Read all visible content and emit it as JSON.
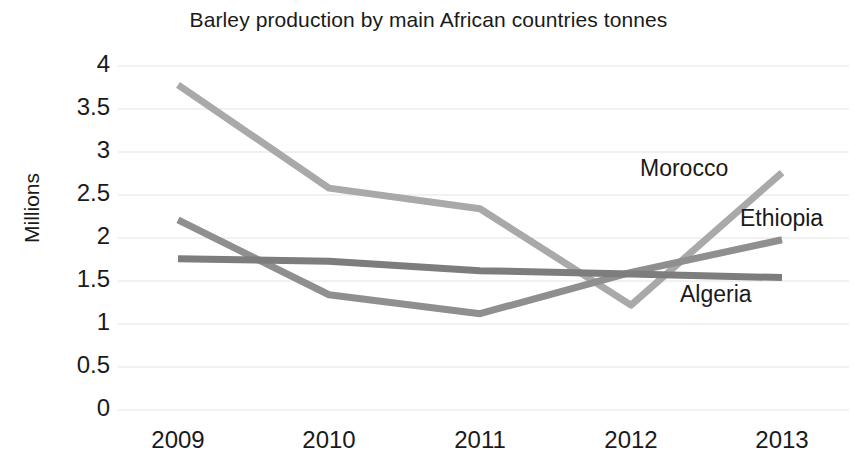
{
  "chart_data": {
    "type": "line",
    "title": "Barley production by main African countries tonnes",
    "xlabel": "",
    "ylabel": "Millions",
    "categories": [
      "2009",
      "2010",
      "2011",
      "2012",
      "2013"
    ],
    "x": [
      2009,
      2010,
      2011,
      2012,
      2013
    ],
    "ylim": [
      0,
      4
    ],
    "y_ticks": [
      "0",
      "0.5",
      "1",
      "1.5",
      "2",
      "2.5",
      "3",
      "3.5",
      "4"
    ],
    "y_tick_values": [
      0,
      0.5,
      1,
      1.5,
      2,
      2.5,
      3,
      3.5,
      4
    ],
    "grid": true,
    "legend_position": "inline-right-annotations",
    "series": [
      {
        "name": "Morocco",
        "color": "#a9a9a9",
        "values": [
          3.78,
          2.58,
          2.34,
          1.22,
          2.76
        ]
      },
      {
        "name": "Ethiopia",
        "color": "#8f8f8f",
        "values": [
          2.21,
          1.34,
          1.12,
          1.6,
          1.98
        ]
      },
      {
        "name": "Algeria",
        "color": "#7d7d7d",
        "values": [
          1.76,
          1.73,
          1.62,
          1.58,
          1.54
        ]
      }
    ],
    "annotations": [
      {
        "text": "Morocco",
        "x_px": 640,
        "y_px": 157
      },
      {
        "text": "Ethiopia",
        "x_px": 740,
        "y_px": 207
      },
      {
        "text": "Algeria",
        "x_px": 680,
        "y_px": 283
      }
    ]
  },
  "axes": {
    "y_labels": [
      "4",
      "3.5",
      "3",
      "2.5",
      "2",
      "1.5",
      "1",
      "0.5",
      "0"
    ],
    "x_labels": [
      "2009",
      "2010",
      "2011",
      "2012",
      "2013"
    ],
    "y_title": "Millions"
  },
  "colors": {
    "grid": "#e3e3e3",
    "text": "#1a1a1a",
    "background": "#ffffff",
    "morocco": "#a9a9a9",
    "ethiopia": "#8f8f8f",
    "algeria": "#7d7d7d"
  }
}
